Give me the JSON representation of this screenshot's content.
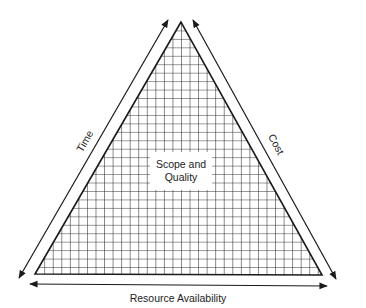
{
  "diagram": {
    "type": "project-management-triangle",
    "center_label_line1": "Scope and",
    "center_label_line2": "Quality",
    "left_side_label": "Time",
    "right_side_label": "Cost",
    "bottom_label": "Resource Availability",
    "colors": {
      "stroke": "#1a1a1a",
      "grid": "#2a2a2a",
      "background": "#ffffff",
      "text": "#222222"
    }
  }
}
